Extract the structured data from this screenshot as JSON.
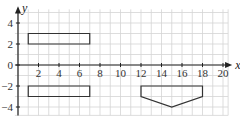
{
  "chart_data": {
    "type": "diagram",
    "title": "",
    "xlabel": "x",
    "ylabel": "y",
    "xlim": [
      0,
      20
    ],
    "ylim": [
      -5,
      5
    ],
    "grid": true,
    "x_ticks": [
      "2",
      "4",
      "6",
      "8",
      "10",
      "12",
      "14",
      "16",
      "18",
      "20"
    ],
    "y_ticks": [
      "4",
      "2",
      "0",
      "-2",
      "-4"
    ],
    "shapes": [
      {
        "name": "rectangle-upper",
        "type": "polygon",
        "points": [
          [
            1,
            2
          ],
          [
            7,
            2
          ],
          [
            7,
            3
          ],
          [
            1,
            3
          ]
        ]
      },
      {
        "name": "rectangle-lower",
        "type": "polygon",
        "points": [
          [
            1,
            -2
          ],
          [
            7,
            -2
          ],
          [
            7,
            -3
          ],
          [
            1,
            -3
          ]
        ]
      },
      {
        "name": "pentagon",
        "type": "polygon",
        "points": [
          [
            12,
            -2
          ],
          [
            18,
            -2
          ],
          [
            18,
            -3
          ],
          [
            15,
            -4
          ],
          [
            12,
            -3
          ]
        ]
      }
    ]
  },
  "axes": {
    "x_label": "x",
    "y_label": "y",
    "origin_label": "0"
  }
}
